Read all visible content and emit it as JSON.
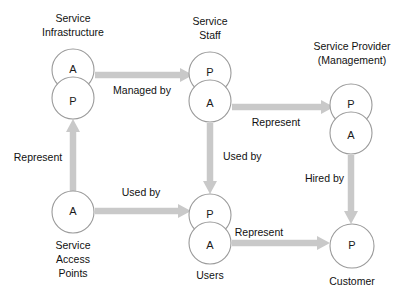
{
  "diagram": {
    "background_color": "#ffffff",
    "node_stroke_color": "#9a9a9a",
    "node_fill_color": "#ffffff",
    "arrow_color": "#c9c9c9",
    "text_color": "#111111",
    "groups": [
      {
        "id": "service-infrastructure",
        "label": "Service\nInfrastructure",
        "label_lines": [
          "Service",
          "Infrastructure"
        ],
        "label_position": "above",
        "circles": [
          {
            "letter": "A",
            "cx": 73,
            "cy": 70,
            "r": 21
          },
          {
            "letter": "P",
            "cx": 73,
            "cy": 98,
            "r": 21
          }
        ]
      },
      {
        "id": "service-staff",
        "label": "Service\nStaff",
        "label_lines": [
          "Service",
          "Staff"
        ],
        "label_position": "above",
        "circles": [
          {
            "letter": "P",
            "cx": 210,
            "cy": 73,
            "r": 21
          },
          {
            "letter": "A",
            "cx": 210,
            "cy": 101,
            "r": 21
          }
        ]
      },
      {
        "id": "service-provider",
        "label": "Service Provider\n(Management)",
        "label_lines": [
          "Service Provider",
          "(Management)"
        ],
        "label_position": "above",
        "circles": [
          {
            "letter": "P",
            "cx": 351,
            "cy": 105,
            "r": 21
          },
          {
            "letter": "A",
            "cx": 351,
            "cy": 133,
            "r": 21
          }
        ]
      },
      {
        "id": "service-access-points",
        "label": "Service\nAccess\nPoints",
        "label_lines": [
          "Service",
          "Access",
          "Points"
        ],
        "label_position": "below",
        "circles": [
          {
            "letter": "A",
            "cx": 73,
            "cy": 212,
            "r": 21
          }
        ]
      },
      {
        "id": "users",
        "label": "Users",
        "label_lines": [
          "Users"
        ],
        "label_position": "below",
        "circles": [
          {
            "letter": "P",
            "cx": 210,
            "cy": 215,
            "r": 21
          },
          {
            "letter": "A",
            "cx": 210,
            "cy": 243,
            "r": 21
          }
        ]
      },
      {
        "id": "customer",
        "label": "Customer",
        "label_lines": [
          "Customer"
        ],
        "label_position": "below",
        "circles": [
          {
            "letter": "P",
            "cx": 352,
            "cy": 246,
            "r": 22
          }
        ]
      }
    ],
    "edges": [
      {
        "id": "managed-by",
        "label": "Managed by",
        "from": "service-infrastructure",
        "to": "service-staff",
        "direction": "right",
        "label_x": 142,
        "label_y": 94
      },
      {
        "id": "represent-staff-provider",
        "label": "Represent",
        "from": "service-staff",
        "to": "service-provider",
        "direction": "right",
        "label_x": 276,
        "label_y": 126
      },
      {
        "id": "represent-access-infrastructure",
        "label": "Represent",
        "from": "service-access-points",
        "to": "service-infrastructure",
        "direction": "up",
        "label_x": 38,
        "label_y": 161
      },
      {
        "id": "used-by-access-users",
        "label": "Used by",
        "from": "service-access-points",
        "to": "users",
        "direction": "right",
        "label_x": 141,
        "label_y": 196
      },
      {
        "id": "used-by-staff-users",
        "label": "Used by",
        "from": "service-staff",
        "to": "users",
        "direction": "down",
        "label_x": 223,
        "label_y": 160
      },
      {
        "id": "hired-by-provider-customer",
        "label": "Hired by",
        "from": "service-provider",
        "to": "customer",
        "direction": "down",
        "label_x": 308,
        "label_y": 182
      },
      {
        "id": "represent-users-customer",
        "label": "Represent",
        "from": "users",
        "to": "customer",
        "direction": "right",
        "label_x": 259,
        "label_y": 236
      }
    ]
  }
}
